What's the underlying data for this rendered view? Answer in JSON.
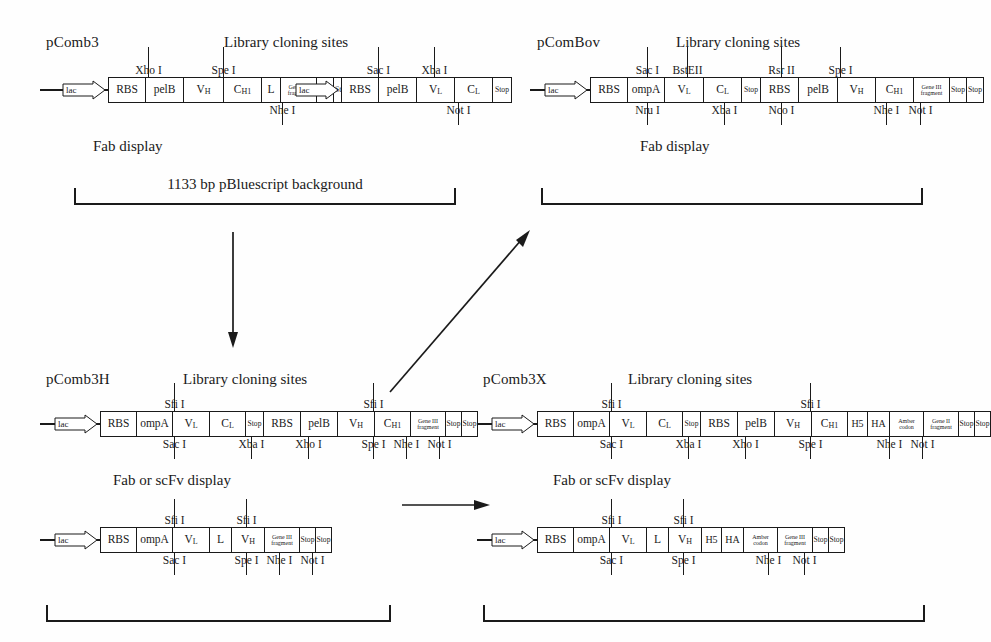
{
  "figure": {
    "title_text": "Library cloning sites",
    "background_bracket_label": "1133 bp pBluescript background",
    "fab_display": "Fab display",
    "fab_or_scfv_display": "Fab or scFv display",
    "ink_color": "#1a1a1a",
    "paper_color": "#fefefe"
  },
  "constructs": {
    "pcomb3": {
      "name": "pComb3",
      "cloning_title": "Library cloning sites",
      "display": "Fab display",
      "segments": [
        {
          "label": "lac",
          "type": "promoter"
        },
        {
          "label": "RBS"
        },
        {
          "label": "pelB"
        },
        {
          "label": "V",
          "sub": "H"
        },
        {
          "label": "C",
          "sub": "H1"
        },
        {
          "label": "L"
        },
        {
          "label": "Gene III fragment",
          "style": "micro"
        },
        {
          "label": "Stop",
          "style": "tiny"
        },
        {
          "label": "Stop",
          "style": "tiny"
        },
        {
          "label": "lac",
          "type": "promoter"
        },
        {
          "label": "RBS"
        },
        {
          "label": "pelB"
        },
        {
          "label": "V",
          "sub": "L"
        },
        {
          "label": "C",
          "sub": "L"
        },
        {
          "label": "Stop",
          "style": "tiny"
        }
      ],
      "sites_above": [
        "Xho I",
        "Spe I",
        "Sac I",
        "Xba I"
      ],
      "sites_below": [
        "Nhe I",
        "Not I"
      ]
    },
    "pcombov": {
      "name": "pComBov",
      "cloning_title": "Library cloning sites",
      "display": "Fab display",
      "segments": [
        {
          "label": "lac",
          "type": "promoter"
        },
        {
          "label": "RBS"
        },
        {
          "label": "ompA"
        },
        {
          "label": "V",
          "sub": "L"
        },
        {
          "label": "C",
          "sub": "L"
        },
        {
          "label": "Stop",
          "style": "tiny"
        },
        {
          "label": "RBS"
        },
        {
          "label": "pelB"
        },
        {
          "label": "V",
          "sub": "H"
        },
        {
          "label": "C",
          "sub": "H1"
        },
        {
          "label": "Gene III fragment",
          "style": "micro"
        },
        {
          "label": "Stop",
          "style": "tiny"
        },
        {
          "label": "Stop",
          "style": "tiny"
        }
      ],
      "sites_above": [
        "Sac I",
        "BstEII",
        "Rsr II",
        "Spe I"
      ],
      "sites_below": [
        "Nru I",
        "Xba I",
        "Nco I",
        "Nhe I",
        "Not I"
      ]
    },
    "pcomb3h": {
      "name": "pComb3H",
      "cloning_title": "Library cloning sites",
      "display": "Fab or scFv display",
      "segments": [
        {
          "label": "lac",
          "type": "promoter"
        },
        {
          "label": "RBS"
        },
        {
          "label": "ompA"
        },
        {
          "label": "V",
          "sub": "L"
        },
        {
          "label": "C",
          "sub": "L"
        },
        {
          "label": "Stop",
          "style": "tiny"
        },
        {
          "label": "RBS"
        },
        {
          "label": "pelB"
        },
        {
          "label": "V",
          "sub": "H"
        },
        {
          "label": "C",
          "sub": "H1"
        },
        {
          "label": "Gene III fragment",
          "style": "micro"
        },
        {
          "label": "Stop",
          "style": "tiny"
        },
        {
          "label": "Stop",
          "style": "tiny"
        }
      ],
      "sites_above": [
        "Sfi I",
        "Sfi I"
      ],
      "sites_below": [
        "Sac I",
        "Xba I",
        "Xho I",
        "Spe I",
        "Nhe I",
        "Not I"
      ]
    },
    "pcomb3x": {
      "name": "pComb3X",
      "cloning_title": "Library cloning sites",
      "display": "Fab or scFv display",
      "segments": [
        {
          "label": "lac",
          "type": "promoter"
        },
        {
          "label": "RBS"
        },
        {
          "label": "ompA"
        },
        {
          "label": "V",
          "sub": "L"
        },
        {
          "label": "C",
          "sub": "L"
        },
        {
          "label": "Stop",
          "style": "tiny"
        },
        {
          "label": "RBS"
        },
        {
          "label": "pelB"
        },
        {
          "label": "V",
          "sub": "H"
        },
        {
          "label": "C",
          "sub": "H1"
        },
        {
          "label": "H5"
        },
        {
          "label": "HA"
        },
        {
          "label": "Amber codon",
          "style": "micro"
        },
        {
          "label": "Gene II fragment",
          "style": "micro"
        },
        {
          "label": "Stop",
          "style": "tiny"
        },
        {
          "label": "Stop",
          "style": "tiny"
        }
      ],
      "sites_above": [
        "Sfi I",
        "Sfi I"
      ],
      "sites_below": [
        "Sac I",
        "Xba I",
        "Xho I",
        "Spe I",
        "Nhe I",
        "Not I"
      ]
    },
    "scfv_left": {
      "segments": [
        {
          "label": "lac",
          "type": "promoter"
        },
        {
          "label": "RBS"
        },
        {
          "label": "ompA"
        },
        {
          "label": "V",
          "sub": "L"
        },
        {
          "label": "L"
        },
        {
          "label": "V",
          "sub": "H"
        },
        {
          "label": "Gene III fragment",
          "style": "micro"
        },
        {
          "label": "Stop",
          "style": "tiny"
        },
        {
          "label": "Stop",
          "style": "tiny"
        }
      ],
      "sites_above": [
        "Sfi I",
        "Sfi I"
      ],
      "sites_below": [
        "Sac I",
        "Spe I",
        "Nhe I",
        "Not I"
      ]
    },
    "scfv_right": {
      "segments": [
        {
          "label": "lac",
          "type": "promoter"
        },
        {
          "label": "RBS"
        },
        {
          "label": "ompA"
        },
        {
          "label": "V",
          "sub": "L"
        },
        {
          "label": "L"
        },
        {
          "label": "V",
          "sub": "H"
        },
        {
          "label": "H5"
        },
        {
          "label": "HA"
        },
        {
          "label": "Amber codon",
          "style": "micro"
        },
        {
          "label": "Gene III fragment",
          "style": "micro"
        },
        {
          "label": "Stop",
          "style": "tiny"
        },
        {
          "label": "Stop",
          "style": "tiny"
        }
      ],
      "sites_above": [
        "Sfi I",
        "Sfi I"
      ],
      "sites_below": [
        "Sac I",
        "Spe I",
        "Nhe I",
        "Not I"
      ]
    }
  }
}
